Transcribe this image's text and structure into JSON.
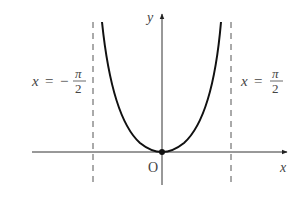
{
  "figure": {
    "axes": {
      "x_label": "x",
      "y_label": "y",
      "origin_label": "O"
    },
    "asymptotes": [
      {
        "lhs": "x",
        "eq": "=",
        "sign": "−",
        "num": "π",
        "den": "2"
      },
      {
        "lhs": "x",
        "eq": "=",
        "sign": "",
        "num": "π",
        "den": "2"
      }
    ],
    "colors": {
      "curve": "#111111",
      "axes": "#333333",
      "asymptote": "#555555",
      "text": "#444444"
    }
  }
}
